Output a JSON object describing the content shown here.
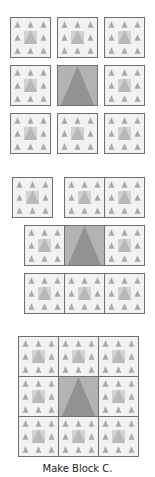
{
  "figure": {
    "caption": "Make Block C.",
    "colors": {
      "outline": "#6e6e6e",
      "background": "#f2f2f2",
      "small_triangle": "#a9a9a9",
      "center_square": "#d2d2d2",
      "center_triangle": "#b8b8b8",
      "big_square": "#b3b3b3",
      "big_triangle": "#929292"
    },
    "steps": [
      {
        "label": "step-1-layout",
        "description": "Nine blocks laid out with gaps: 8 pieced blocks around a plain center triangle block"
      },
      {
        "label": "step-2-rows",
        "description": "Blocks sewn into three rows"
      },
      {
        "label": "step-3-assembled",
        "description": "Rows joined into finished Block C"
      }
    ]
  }
}
